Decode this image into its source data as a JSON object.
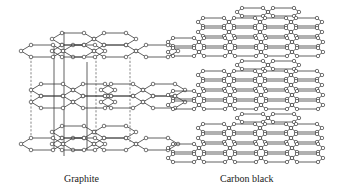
{
  "figure": {
    "panels": [
      {
        "id": "graphite",
        "label": "Graphite",
        "label_pos": [
          64,
          173
        ]
      },
      {
        "id": "carbon-black",
        "label": "Carbon black",
        "label_pos": [
          220,
          173
        ]
      }
    ],
    "colors": {
      "bond": "#3a3a3a",
      "atom_fill": "#ffffff",
      "background": "#ffffff"
    },
    "graphite": {
      "sheets": [
        {
          "name": "top-sheet",
          "y": 51,
          "chains": [
            {
              "x0": 21,
              "dy": 0,
              "rings": 2
            },
            {
              "x0": 52,
              "dy": -12,
              "rings": 2
            },
            {
              "x0": 52,
              "dy": 0,
              "rings": 3
            }
          ]
        },
        {
          "name": "middle-sheet",
          "y": 96,
          "chains": [
            {
              "x0": 31,
              "dy": -6,
              "rings": 2
            },
            {
              "x0": 31,
              "dy": 6,
              "rings": 2
            },
            {
              "x0": 101,
              "dy": -6,
              "rings": 2
            },
            {
              "x0": 101,
              "dy": 6,
              "rings": 2
            }
          ]
        },
        {
          "name": "bottom-sheet",
          "y": 144,
          "chains": [
            {
              "x0": 21,
              "dy": 0,
              "rings": 2
            },
            {
              "x0": 52,
              "dy": -12,
              "rings": 2
            },
            {
              "x0": 52,
              "dy": 0,
              "rings": 3
            }
          ]
        }
      ],
      "vertical_lines": [
        {
          "x": 54,
          "y1": 46,
          "y2": 150
        },
        {
          "x": 64,
          "y1": 32,
          "y2": 156
        },
        {
          "x": 87,
          "y1": 62,
          "y2": 150
        }
      ],
      "dashed_lines": [
        {
          "x": 31,
          "y1": 57,
          "y2": 138
        },
        {
          "x": 96,
          "y1": 57,
          "y2": 138
        },
        {
          "x": 130,
          "y1": 57,
          "y2": 142
        }
      ]
    },
    "carbon_black": {
      "stacks": [
        {
          "name": "top-stack",
          "rows": [
            {
              "x0": 199,
              "y": 12,
              "rings": 2,
              "offset": 38
            },
            {
              "x0": 198,
              "y": 22,
              "rings": 4
            },
            {
              "x0": 198,
              "y": 32,
              "rings": 4
            },
            {
              "x0": 168,
              "y": 42,
              "rings": 5
            },
            {
              "x0": 168,
              "y": 52,
              "rings": 5
            }
          ]
        },
        {
          "name": "middle-stack",
          "rows": [
            {
              "x0": 199,
              "y": 65,
              "rings": 2,
              "offset": 38
            },
            {
              "x0": 198,
              "y": 75,
              "rings": 4
            },
            {
              "x0": 198,
              "y": 85,
              "rings": 4
            },
            {
              "x0": 168,
              "y": 95,
              "rings": 5
            },
            {
              "x0": 168,
              "y": 105,
              "rings": 5
            }
          ]
        },
        {
          "name": "bottom-stack",
          "rows": [
            {
              "x0": 199,
              "y": 118,
              "rings": 2,
              "offset": 38
            },
            {
              "x0": 198,
              "y": 128,
              "rings": 4
            },
            {
              "x0": 198,
              "y": 138,
              "rings": 4
            },
            {
              "x0": 168,
              "y": 148,
              "rings": 5
            },
            {
              "x0": 168,
              "y": 158,
              "rings": 5
            }
          ]
        }
      ]
    }
  }
}
